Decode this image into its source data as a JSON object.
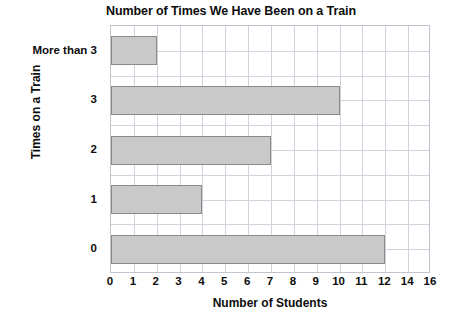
{
  "chart_data": {
    "type": "bar",
    "orientation": "horizontal",
    "title": "Number of Times We Have Been on a Train",
    "xlabel": "Number of Students",
    "ylabel": "Times on a Train",
    "categories": [
      "0",
      "1",
      "2",
      "3",
      "More than 3"
    ],
    "values": [
      12,
      4,
      7,
      10,
      2
    ],
    "category_order_top_to_bottom": [
      "More than 3",
      "3",
      "2",
      "1",
      "0"
    ],
    "xtick_labels": [
      "0",
      "1",
      "2",
      "3",
      "4",
      "5",
      "6",
      "7",
      "8",
      "9",
      "10",
      "11",
      "12",
      "14",
      "16"
    ],
    "xtick_positions": [
      0,
      1,
      2,
      3,
      4,
      5,
      6,
      7,
      8,
      9,
      10,
      11,
      12,
      13,
      14
    ],
    "xlim": [
      0,
      14
    ],
    "grid": true,
    "legend": "none",
    "colors": {
      "bar_fill": "#c9c9c9",
      "bar_border": "#8a8a8a",
      "gridline": "#d2d2dc",
      "plot_border": "#c3c3cf",
      "text": "#0d0d0d",
      "background": "#ffffff"
    }
  }
}
